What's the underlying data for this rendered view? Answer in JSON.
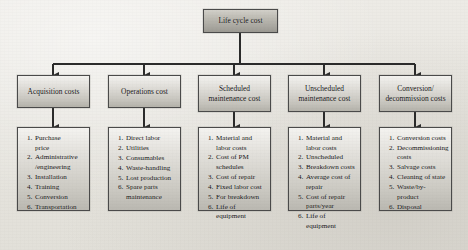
{
  "diagram": {
    "type": "hierarchical-tree",
    "colors": {
      "box_border": "#4a4a4a",
      "box_fill_top": "#f3f2ef",
      "box_fill_bottom": "#b4b2aa",
      "root_fill_top": "#d2d0c9",
      "root_fill_bottom": "#9b9992",
      "connector": "#2a2a2a",
      "background": "#e9e7e2"
    },
    "root": {
      "label": "Life cycle cost"
    },
    "branches": [
      {
        "heading": "Acquisition\ncosts",
        "items": [
          "Purchase\nprice",
          "Administrative\n/engineering",
          "Installation",
          "Training",
          "Conversion",
          "Transportation"
        ]
      },
      {
        "heading": "Operations cost",
        "items": [
          "Direct labor",
          "Utilities",
          "Consumables",
          "Waste-handling",
          "Lost production",
          "Spare parts\nmaintenance"
        ]
      },
      {
        "heading": "Scheduled\nmaintenance\ncost",
        "items": [
          "Material and\nlabor costs",
          "Cost of PM\nschedules",
          "Cost of repair",
          "Fixed labor cost",
          "For breakdown",
          "Life of equipment"
        ]
      },
      {
        "heading": "Unscheduled\nmaintenance\ncost",
        "items": [
          "Material and\nlabor costs",
          "Unscheduled",
          "Breakdown costs",
          "Average cost of\nrepair",
          "Cost of repair\nparts/year",
          "Life of equipment"
        ]
      },
      {
        "heading": "Conversion/\ndecommission\ncosts",
        "items": [
          "Conversion costs",
          "Decommissioning\ncosts",
          "Salvage costs",
          "Cleaning of state",
          "Waste/by-product",
          "Disposal"
        ]
      }
    ]
  }
}
